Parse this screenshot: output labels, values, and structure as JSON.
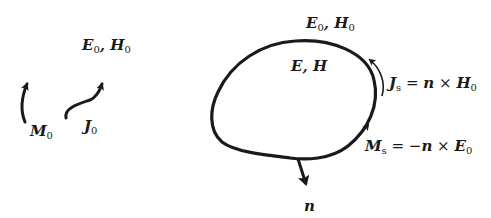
{
  "figure": {
    "left_region": {
      "field_label": {
        "main": "E",
        "sub": "0",
        "sep": ", ",
        "main2": "H",
        "sub2": "0"
      },
      "source_M": {
        "main": "M",
        "sub": "0"
      },
      "source_J": {
        "main": "J",
        "sub": "0"
      }
    },
    "right_region": {
      "outside_field_label": {
        "main": "E",
        "sub": "0",
        "sep": ", ",
        "main2": "H",
        "sub2": "0"
      },
      "inside_field_label": {
        "main": "E",
        "sep": ", ",
        "main2": "H"
      },
      "surface_current_J": {
        "main": "J",
        "sub": "s",
        "eq": " = ",
        "n": "n",
        "cross": " × ",
        "field": "H",
        "field_sub": "0"
      },
      "surface_current_M": {
        "main": "M",
        "sub": "s",
        "eq": " = −",
        "n": "n",
        "cross": " × ",
        "field": "E",
        "field_sub": "0"
      },
      "normal_label": "n"
    },
    "colors": {
      "ink": "#1a1a1a",
      "background": "#ffffff"
    }
  }
}
